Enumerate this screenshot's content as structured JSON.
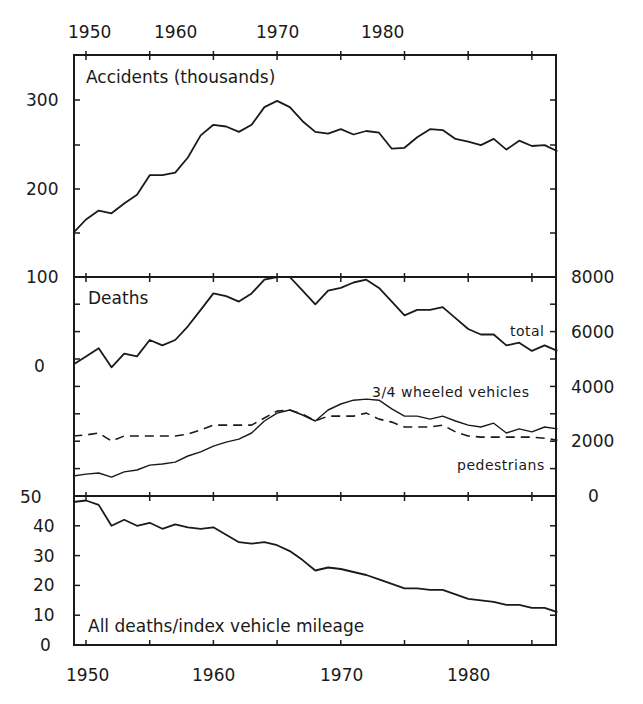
{
  "chart_data": {
    "type": "line",
    "layout": "three stacked panels sharing x-axis (years)",
    "x_axis": {
      "ticks": [
        "1950",
        "1960",
        "1970",
        "1980"
      ],
      "range": [
        1949,
        1987
      ],
      "minor_tick_every_years": 5
    },
    "x": [
      1949,
      1950,
      1951,
      1952,
      1953,
      1954,
      1955,
      1956,
      1957,
      1958,
      1959,
      1960,
      1961,
      1962,
      1963,
      1964,
      1965,
      1966,
      1967,
      1968,
      1969,
      1970,
      1971,
      1972,
      1973,
      1974,
      1975,
      1976,
      1977,
      1978,
      1979,
      1980,
      1981,
      1982,
      1983,
      1984,
      1985,
      1986,
      1987
    ],
    "panels": [
      {
        "id": "accidents",
        "title": "Accidents (thousands)",
        "y_axis_side": "left",
        "y_ticks": [
          "100",
          "200",
          "300"
        ],
        "ylim": [
          100,
          350
        ],
        "grid": false,
        "series": [
          {
            "name": "accidents",
            "style": "solid",
            "values": [
              150,
              165,
              175,
              172,
              183,
              193,
              215,
              215,
              218,
              235,
              260,
              272,
              270,
              264,
              272,
              292,
              299,
              292,
              276,
              264,
              262,
              267,
              261,
              265,
              263,
              245,
              246,
              258,
              267,
              266,
              256,
              253,
              249,
              256,
              244,
              254,
              248,
              249,
              242
            ]
          }
        ]
      },
      {
        "id": "deaths",
        "title": "Deaths",
        "y_axis_side": "right",
        "y_ticks": [
          "0",
          "2000",
          "4000",
          "6000",
          "8000"
        ],
        "left_axis_ticks_visible": [
          "0",
          "100"
        ],
        "ylim": [
          0,
          8000
        ],
        "grid": false,
        "series": [
          {
            "name": "total",
            "label": "total",
            "style": "solid",
            "values": [
              4800,
              5100,
              5400,
              4700,
              5200,
              5100,
              5700,
              5500,
              5700,
              6200,
              6800,
              7400,
              7300,
              7100,
              7400,
              7900,
              8000,
              8000,
              7500,
              7000,
              7500,
              7600,
              7800,
              7900,
              7600,
              7100,
              6600,
              6800,
              6800,
              6900,
              6500,
              6100,
              5900,
              5900,
              5500,
              5600,
              5300,
              5500,
              5300
            ]
          },
          {
            "name": "3/4 wheeled vehicles",
            "label": "3/4 wheeled vehicles",
            "style": "solid-thin",
            "values": [
              730,
              800,
              840,
              690,
              880,
              950,
              1130,
              1170,
              1240,
              1460,
              1610,
              1820,
              1970,
              2080,
              2300,
              2740,
              3030,
              3140,
              2960,
              2740,
              3140,
              3360,
              3500,
              3540,
              3500,
              3180,
              2920,
              2920,
              2810,
              2920,
              2740,
              2590,
              2520,
              2660,
              2300,
              2450,
              2340,
              2520,
              2450
            ]
          },
          {
            "name": "pedestrians",
            "label": "pedestrians",
            "style": "dashed",
            "values": [
              2190,
              2230,
              2300,
              2010,
              2190,
              2190,
              2190,
              2190,
              2190,
              2260,
              2410,
              2590,
              2590,
              2590,
              2590,
              2850,
              3100,
              3140,
              2990,
              2740,
              2920,
              2920,
              2920,
              3030,
              2810,
              2700,
              2520,
              2520,
              2520,
              2590,
              2340,
              2190,
              2150,
              2150,
              2150,
              2150,
              2150,
              2110,
              2040
            ]
          }
        ]
      },
      {
        "id": "rate",
        "title": "All deaths/index vehicle mileage",
        "y_axis_side": "left",
        "y_ticks": [
          "0",
          "10",
          "20",
          "30",
          "40",
          "50"
        ],
        "ylim": [
          0,
          50
        ],
        "grid": false,
        "series": [
          {
            "name": "all deaths per index vehicle mileage",
            "style": "solid",
            "values": [
              48,
              48.5,
              47,
              40,
              42,
              40,
              41,
              39,
              40.5,
              39.5,
              39,
              39.5,
              37,
              34.5,
              34,
              34.5,
              33.5,
              31.5,
              28.5,
              25,
              26,
              25.5,
              24.5,
              23.5,
              22,
              20.5,
              19,
              19,
              18.5,
              18.5,
              17,
              15.5,
              15,
              14.5,
              13.5,
              13.5,
              12.5,
              12.5,
              11
            ]
          }
        ]
      }
    ],
    "legend": "inline labels next to lines (total, 3/4 wheeled vehicles, pedestrians)"
  },
  "labels": {
    "top_years": [
      "1950",
      "1960",
      "1970",
      "1980"
    ],
    "bottom_years": [
      "1950",
      "1960",
      "1970",
      "1980"
    ],
    "accidents_title": "Accidents (thousands)",
    "accidents_ticks": [
      "300",
      "200",
      "100"
    ],
    "deaths_title": "Deaths",
    "deaths_left_ticks": [
      "100",
      "0"
    ],
    "deaths_right_ticks": [
      "8000",
      "6000",
      "4000",
      "2000",
      "0"
    ],
    "total_label": "total",
    "vehicles_label": "3/4 wheeled vehicles",
    "pedestrians_label": "pedestrians",
    "rate_title": "All deaths/index vehicle mileage",
    "rate_ticks": [
      "50",
      "40",
      "30",
      "20",
      "10",
      "0"
    ]
  }
}
